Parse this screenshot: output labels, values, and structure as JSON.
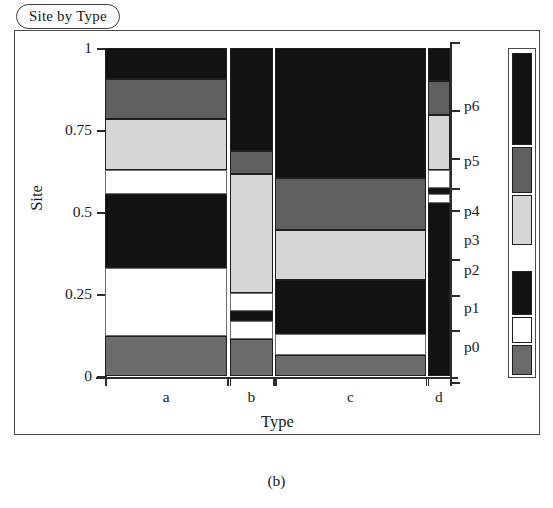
{
  "title": {
    "text": "Site by Type"
  },
  "caption": {
    "text": "(b)"
  },
  "axes": {
    "y_label": "Site",
    "x_label": "Type",
    "y_ticks": [
      {
        "value": 1,
        "label": "1"
      },
      {
        "value": 0.75,
        "label": "0.75"
      },
      {
        "value": 0.5,
        "label": "0.5"
      },
      {
        "value": 0.25,
        "label": "0.25"
      },
      {
        "value": 0,
        "label": "0"
      }
    ],
    "x_ticks": [
      {
        "label": "a"
      },
      {
        "label": "b"
      },
      {
        "label": "c"
      },
      {
        "label": "d"
      }
    ],
    "right_ticks": [
      {
        "label": "p6"
      },
      {
        "label": "p5"
      },
      {
        "label": "p4"
      },
      {
        "label": "p3"
      },
      {
        "label": "p2"
      },
      {
        "label": "p1"
      },
      {
        "label": "p0"
      }
    ]
  },
  "legend": {
    "title": "Site",
    "entries": [
      {
        "name": "p6",
        "color": "#121212"
      },
      {
        "name": "p5",
        "color": "#5f5f5f"
      },
      {
        "name": "p4",
        "color": "#d6d6d6"
      },
      {
        "name": "p3",
        "color": "#ffffff"
      },
      {
        "name": "p2",
        "color": "#121212"
      },
      {
        "name": "p1",
        "color": "#ffffff"
      },
      {
        "name": "p0",
        "color": "#6b6b6b"
      }
    ]
  },
  "chart_data": {
    "type": "mosaic",
    "title": "Site by Type",
    "xlabel": "Type",
    "ylabel": "Site",
    "ylim": [
      0,
      1
    ],
    "grid": false,
    "legend_position": "right",
    "x_categories": [
      "a",
      "b",
      "c",
      "d"
    ],
    "y_categories": [
      "p0",
      "p1",
      "p2",
      "p3",
      "p4",
      "p5",
      "p6"
    ],
    "column_widths": [
      0.355,
      0.125,
      0.437,
      0.072
    ],
    "colors": {
      "p0": "#6b6b6b",
      "p1": "#ffffff",
      "p2": "#121212",
      "p3": "#ffffff",
      "p4": "#d6d6d6",
      "p5": "#5f5f5f",
      "p6": "#121212"
    },
    "columns": [
      {
        "name": "a",
        "x0": 0.0,
        "x1": 0.355,
        "tiles": [
          {
            "category": "p6",
            "y0": 0.907,
            "y1": 1.0,
            "color": "#121212"
          },
          {
            "category": "p5",
            "y0": 0.784,
            "y1": 0.907,
            "color": "#5f5f5f"
          },
          {
            "category": "p4",
            "y0": 0.628,
            "y1": 0.784,
            "color": "#d6d6d6"
          },
          {
            "category": "p3",
            "y0": 0.555,
            "y1": 0.628,
            "color": "#ffffff"
          },
          {
            "category": "p2",
            "y0": 0.329,
            "y1": 0.555,
            "color": "#121212"
          },
          {
            "category": "p1",
            "y0": 0.122,
            "y1": 0.329,
            "color": "#ffffff"
          },
          {
            "category": "p0",
            "y0": 0.0,
            "y1": 0.122,
            "color": "#6b6b6b"
          }
        ]
      },
      {
        "name": "b",
        "x0": 0.362,
        "x1": 0.487,
        "tiles": [
          {
            "category": "p6",
            "y0": 0.686,
            "y1": 1.0,
            "color": "#121212"
          },
          {
            "category": "p5",
            "y0": 0.616,
            "y1": 0.686,
            "color": "#5f5f5f"
          },
          {
            "category": "p4",
            "y0": 0.253,
            "y1": 0.616,
            "color": "#d6d6d6"
          },
          {
            "category": "p3",
            "y0": 0.198,
            "y1": 0.253,
            "color": "#ffffff"
          },
          {
            "category": "p2",
            "y0": 0.168,
            "y1": 0.198,
            "color": "#121212"
          },
          {
            "category": "p1",
            "y0": 0.113,
            "y1": 0.168,
            "color": "#ffffff"
          },
          {
            "category": "p0",
            "y0": 0.0,
            "y1": 0.113,
            "color": "#6b6b6b"
          }
        ]
      },
      {
        "name": "c",
        "x0": 0.493,
        "x1": 0.93,
        "tiles": [
          {
            "category": "p6",
            "y0": 0.604,
            "y1": 1.0,
            "color": "#121212"
          },
          {
            "category": "p5",
            "y0": 0.445,
            "y1": 0.604,
            "color": "#5f5f5f"
          },
          {
            "category": "p4",
            "y0": 0.293,
            "y1": 0.445,
            "color": "#d6d6d6"
          },
          {
            "category": "p2",
            "y0": 0.128,
            "y1": 0.293,
            "color": "#121212"
          },
          {
            "category": "p1",
            "y0": 0.064,
            "y1": 0.128,
            "color": "#ffffff"
          },
          {
            "category": "p0",
            "y0": 0.0,
            "y1": 0.064,
            "color": "#6b6b6b"
          }
        ]
      },
      {
        "name": "d",
        "x0": 0.936,
        "x1": 1.0,
        "tiles": [
          {
            "category": "p6",
            "y0": 0.899,
            "y1": 1.0,
            "color": "#121212"
          },
          {
            "category": "p5",
            "y0": 0.796,
            "y1": 0.899,
            "color": "#5f5f5f"
          },
          {
            "category": "p4",
            "y0": 0.628,
            "y1": 0.796,
            "color": "#d6d6d6"
          },
          {
            "category": "p3",
            "y0": 0.573,
            "y1": 0.628,
            "color": "#ffffff"
          },
          {
            "category": "p2",
            "y0": 0.555,
            "y1": 0.573,
            "color": "#121212"
          },
          {
            "category": "p1",
            "y0": 0.527,
            "y1": 0.555,
            "color": "#ffffff"
          },
          {
            "category": "p0",
            "y0": 0.0,
            "y1": 0.527,
            "color": "#121212"
          }
        ]
      }
    ]
  }
}
